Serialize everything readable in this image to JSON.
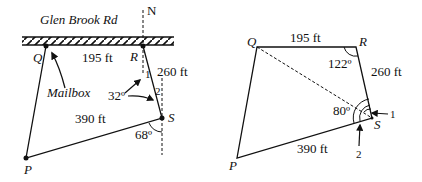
{
  "left_figure": {
    "road_label": "Glen Brook Rd",
    "north_label": "N",
    "points": {
      "Q": "Q",
      "R": "R",
      "S": "S",
      "P": "P"
    },
    "sides": {
      "QR": "195 ft",
      "RS": "260 ft",
      "SP": "390 ft"
    },
    "mailbox_label": "Mailbox",
    "angle_32": "32º",
    "angle_68": "68º",
    "angle_marks": {
      "one": "1",
      "two": "2"
    }
  },
  "right_figure": {
    "points": {
      "Q": "Q",
      "R": "R",
      "S": "S",
      "P": "P"
    },
    "sides": {
      "QR": "195 ft",
      "RS": "260 ft",
      "SP": "390 ft"
    },
    "angle_R": "122º",
    "angle_S": "80º",
    "angle_marks": {
      "one": "1",
      "two": "2"
    }
  }
}
